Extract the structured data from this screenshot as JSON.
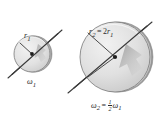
{
  "figure": {
    "background_color": "#ffffff",
    "ink_color": "#2b2b2b",
    "disk_fill_light": "#e8e8e8",
    "disk_fill_mid": "#cfcfcf",
    "disk_edge_color": "#8d8d8d",
    "arrow_shade_color": "#9a9a9a"
  },
  "disks": [
    {
      "id": "small-disk",
      "name": "disk-1",
      "center_x": 32,
      "center_y": 54,
      "radius": 18,
      "radius_label": "r",
      "radius_subscript": "1",
      "angular_label": "ω",
      "angular_subscript": "1"
    },
    {
      "id": "large-disk",
      "name": "disk-2",
      "center_x": 115,
      "center_y": 57,
      "radius": 35,
      "radius_label": "r",
      "radius_subscript": "2",
      "angular_label": "ω",
      "angular_subscript": "2"
    }
  ],
  "labels": {
    "r1": {
      "text": "r",
      "sub": "1"
    },
    "r2": {
      "lhs": "r",
      "lhs_sub": "2",
      "equals": "=",
      "coefficient": "2",
      "rhs": "r",
      "rhs_sub": "1"
    },
    "omega1": {
      "text": "ω",
      "sub": "1"
    },
    "omega2": {
      "lhs": "ω",
      "lhs_sub": "2",
      "equals": "=",
      "fraction_numerator": "1",
      "fraction_denominator": "2",
      "rhs": "ω",
      "rhs_sub": "1"
    }
  },
  "axes": [
    {
      "name": "rotation-axis-1",
      "x1": 8,
      "y1": 78,
      "x2": 62,
      "y2": 30
    },
    {
      "name": "rotation-axis-2",
      "x1": 68,
      "y1": 93,
      "x2": 152,
      "y2": 22
    }
  ]
}
